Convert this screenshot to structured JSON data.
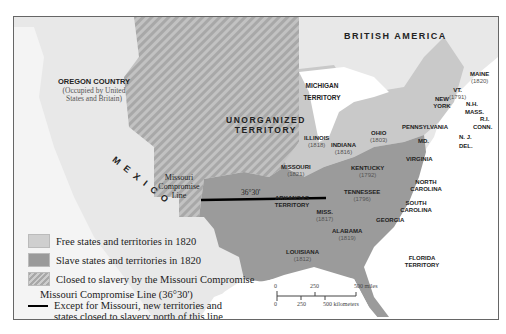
{
  "map": {
    "regions": {
      "british_america": "BRITISH AMERICA",
      "oregon_country": "OREGON COUNTRY",
      "oregon_note": "(Occupied by United States and Britain)",
      "mexico": "M E X I C O",
      "unorganized_1": "UNORGANIZED",
      "unorganized_2": "TERRITORY"
    },
    "states": [
      {
        "name": "MAINE",
        "year": "(1820)"
      },
      {
        "name": "VT.",
        "year": "(1791)"
      },
      {
        "name": "N.H.",
        "year": ""
      },
      {
        "name": "MASS.",
        "year": ""
      },
      {
        "name": "R.I.",
        "year": ""
      },
      {
        "name": "CONN.",
        "year": ""
      },
      {
        "name": "NEW YORK",
        "year": ""
      },
      {
        "name": "PENNSYLVANIA",
        "year": ""
      },
      {
        "name": "N. J.",
        "year": ""
      },
      {
        "name": "DEL.",
        "year": ""
      },
      {
        "name": "MD.",
        "year": ""
      },
      {
        "name": "MICHIGAN TERRITORY",
        "year": ""
      },
      {
        "name": "OHIO",
        "year": "(1803)"
      },
      {
        "name": "INDIANA",
        "year": "(1816)"
      },
      {
        "name": "ILLINOIS",
        "year": "(1818)"
      },
      {
        "name": "MISSOURI",
        "year": "(1821)"
      },
      {
        "name": "KENTUCKY",
        "year": "(1792)"
      },
      {
        "name": "VIRGINIA",
        "year": ""
      },
      {
        "name": "NORTH CAROLINA",
        "year": ""
      },
      {
        "name": "SOUTH CAROLINA",
        "year": ""
      },
      {
        "name": "TENNESSEE",
        "year": "(1796)"
      },
      {
        "name": "GEORGIA",
        "year": ""
      },
      {
        "name": "ALABAMA",
        "year": "(1819)"
      },
      {
        "name": "MISS.",
        "year": "(1817)"
      },
      {
        "name": "LOUISIANA",
        "year": "(1812)"
      },
      {
        "name": "ARKANSAS TERRITORY",
        "year": ""
      },
      {
        "name": "FLORIDA TERRITORY",
        "year": ""
      }
    ],
    "compromise_line_label": "Missouri Compromise Line",
    "compromise_latitude": "36°30'",
    "scale": {
      "miles": [
        "0",
        "250",
        "500 miles"
      ],
      "kilometers": [
        "0",
        "250",
        "500 kilometers"
      ]
    }
  },
  "legend": [
    {
      "label": "Free states and territories in 1820",
      "swatch": "#cfcfcf"
    },
    {
      "label": "Slave states and territories in 1820",
      "swatch": "#9a9a9a"
    },
    {
      "label": "Closed to slavery by the Missouri Compromise",
      "swatch": "hatched"
    }
  ],
  "legend_line": {
    "title": "Missouri Compromise Line (36°30')",
    "desc1": "Except for Missouri, new territories and",
    "desc2": "states closed to slavery north of this line"
  },
  "colors": {
    "free": "#c9c9c9",
    "slave": "#9b9b9b",
    "closed_hatch_a": "#a9a9a9",
    "closed_hatch_b": "#c2c2c2",
    "foreign": "#e8e8e8",
    "water": "#ffffff"
  }
}
